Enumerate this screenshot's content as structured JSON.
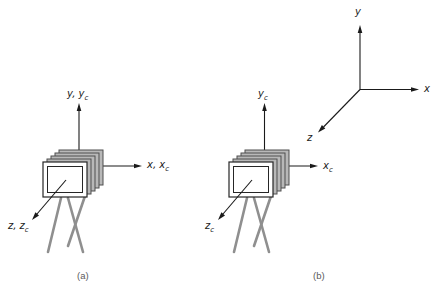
{
  "figure": {
    "panel_a_label": "(a)",
    "panel_b_label": "(b)",
    "caption_partial": "FIGURE 5.10"
  },
  "panel_a": {
    "description": "camera with film-plane stack on tripod; world and camera frames coincident",
    "y_axis": {
      "main": "y, y",
      "sub": "c"
    },
    "x_axis": {
      "main": "x, x",
      "sub": "c"
    },
    "z_axis": {
      "main": "z, z",
      "sub": "c"
    }
  },
  "panel_b": {
    "description": "camera frame separated from world frame",
    "camera": {
      "y_axis": {
        "main": "y",
        "sub": "c"
      },
      "x_axis": {
        "main": "x",
        "sub": "c"
      },
      "z_axis": {
        "main": "z",
        "sub": "c"
      }
    },
    "world": {
      "x_label": "x",
      "y_label": "y",
      "z_label": "z"
    }
  },
  "colors": {
    "axis_line": "#1a1a1a",
    "camera_plane_fill": "#b8b8b8",
    "camera_plane_stroke": "#4f4f4f",
    "camera_front_fill": "#ffffff",
    "tripod": "#8f8f8f",
    "label_text": "#1a1a1a",
    "panel_label_text": "#5a5a5a",
    "background": "#ffffff"
  }
}
